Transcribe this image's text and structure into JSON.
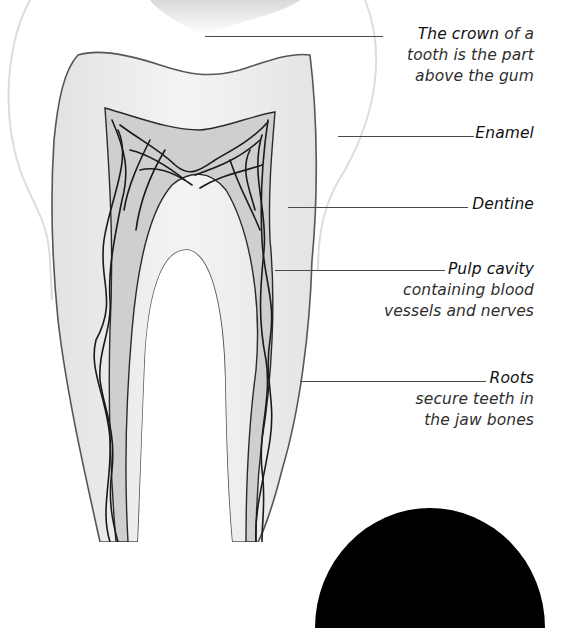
{
  "diagram": {
    "labels": [
      {
        "id": "crown",
        "title": "The crown",
        "desc_inline": " of a",
        "desc_lines": [
          "tooth is the part",
          "above the gum"
        ]
      },
      {
        "id": "enamel",
        "title": "Enamel",
        "desc_lines": []
      },
      {
        "id": "dentine",
        "title": "Dentine",
        "desc_lines": []
      },
      {
        "id": "pulp",
        "title": "Pulp cavity",
        "desc_lines": [
          "containing blood",
          "vessels and nerves"
        ]
      },
      {
        "id": "roots",
        "title": "Roots",
        "desc_lines": [
          "secure teeth in",
          "the jaw bones"
        ]
      }
    ],
    "colors": {
      "background": "#ffffff",
      "enamel_outline": "#d8d8d8",
      "dentine_fill": "#eeeeee",
      "pulp_fill": "#c9c9c9",
      "nerves": "#1a1a1a",
      "leader_line": "#4a4a4a",
      "corner_disc": "#000000"
    }
  }
}
